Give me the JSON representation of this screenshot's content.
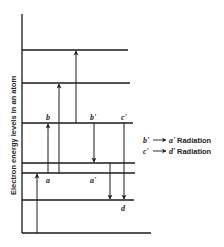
{
  "diagram": {
    "y_axis_label": "Electron energy levels in an atom",
    "energy_levels_y": [
      50,
      83,
      123,
      163,
      173,
      200
    ],
    "labels": {
      "b": "b",
      "b_prime": "b'",
      "c_prime": "c'",
      "a": "a",
      "a_prime": "a'",
      "d": "d"
    },
    "legend": [
      {
        "from": "b'",
        "to": "a'",
        "text": "Radiation"
      },
      {
        "from": "c'",
        "to": "d'",
        "text": "Radiation"
      }
    ],
    "colors": {
      "line": "#1a1a1a",
      "background": "#ffffff"
    }
  }
}
